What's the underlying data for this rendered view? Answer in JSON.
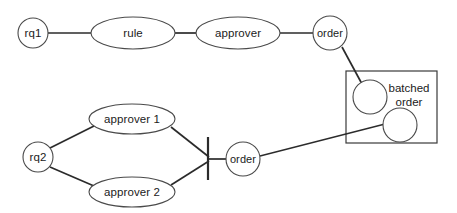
{
  "diagram": {
    "type": "uml-activity-flow-sketch",
    "title": "",
    "canvas": {
      "width": 457,
      "height": 213,
      "background": "#ffffff"
    },
    "style": {
      "stroke": "#2b2b2b",
      "node_stroke": "#4a4a4a",
      "fill": "#ffffff"
    },
    "nodes": [
      {
        "id": "rq1",
        "label": "rq1",
        "shape": "circle",
        "cx": 33,
        "cy": 33,
        "r": 15
      },
      {
        "id": "rule",
        "label": "rule",
        "shape": "ellipse",
        "cx": 133,
        "cy": 33,
        "rx": 42,
        "ry": 16
      },
      {
        "id": "approver",
        "label": "approver",
        "shape": "ellipse",
        "cx": 238,
        "cy": 33,
        "rx": 42,
        "ry": 16
      },
      {
        "id": "order1",
        "label": "order",
        "shape": "circle",
        "cx": 330,
        "cy": 33,
        "r": 17
      },
      {
        "id": "batch1",
        "label": "",
        "shape": "circle",
        "cx": 370,
        "cy": 97,
        "r": 17
      },
      {
        "id": "batch2",
        "label": "",
        "shape": "circle",
        "cx": 400,
        "cy": 125,
        "r": 17
      },
      {
        "id": "rq2",
        "label": "rq2",
        "shape": "circle",
        "cx": 38,
        "cy": 157,
        "r": 15
      },
      {
        "id": "approver1",
        "label": "approver 1",
        "shape": "ellipse",
        "cx": 132,
        "cy": 119,
        "rx": 43,
        "ry": 15
      },
      {
        "id": "approver2",
        "label": "approver 2",
        "shape": "ellipse",
        "cx": 132,
        "cy": 192,
        "rx": 43,
        "ry": 15
      },
      {
        "id": "order2",
        "label": "order",
        "shape": "circle",
        "cx": 243,
        "cy": 159,
        "r": 17
      }
    ],
    "groups": [
      {
        "id": "batched-order-box",
        "label": "batched order",
        "label_lines": [
          "batched",
          "order"
        ],
        "x": 346,
        "y": 71,
        "width": 91,
        "height": 72,
        "label_cx": 409,
        "label_y1": 88,
        "label_y2": 102
      }
    ],
    "bars": [
      {
        "id": "sync-bar",
        "x": 208,
        "y1": 137,
        "y2": 180
      }
    ],
    "edges": [
      {
        "id": "e-rq1-rule",
        "from": "rq1",
        "to": "rule",
        "x1": 48,
        "y1": 33,
        "x2": 91,
        "y2": 33
      },
      {
        "id": "e-rule-approver",
        "from": "rule",
        "to": "approver",
        "x1": 175,
        "y1": 33,
        "x2": 196,
        "y2": 33
      },
      {
        "id": "e-approver-order1",
        "from": "approver",
        "to": "order1",
        "x1": 280,
        "y1": 33,
        "x2": 313,
        "y2": 33
      },
      {
        "id": "e-order1-batch1",
        "from": "order1",
        "to": "batch1",
        "x1": 341,
        "y1": 48,
        "x2": 361,
        "y2": 83
      },
      {
        "id": "e-rq2-approver1",
        "from": "rq2",
        "to": "approver1",
        "x1": 50,
        "y1": 148,
        "x2": 93,
        "y2": 126
      },
      {
        "id": "e-rq2-approver2",
        "from": "rq2",
        "to": "approver2",
        "x1": 50,
        "y1": 167,
        "x2": 93,
        "y2": 186
      },
      {
        "id": "e-approver1-bar",
        "from": "approver1",
        "to": "sync-bar",
        "x1": 171,
        "y1": 127,
        "x2": 208,
        "y2": 157
      },
      {
        "id": "e-approver2-bar",
        "from": "approver2",
        "to": "sync-bar",
        "x1": 171,
        "y1": 185,
        "x2": 208,
        "y2": 160
      },
      {
        "id": "e-bar-order2",
        "from": "sync-bar",
        "to": "order2",
        "x1": 208,
        "y1": 159,
        "x2": 226,
        "y2": 159
      },
      {
        "id": "e-order2-batch2",
        "from": "order2",
        "to": "batch2",
        "x1": 260,
        "y1": 156,
        "x2": 384,
        "y2": 124
      }
    ]
  }
}
